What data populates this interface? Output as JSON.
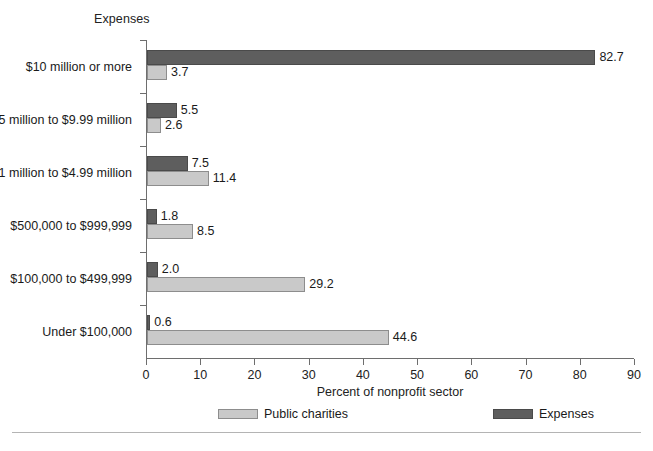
{
  "chart_data": {
    "type": "bar",
    "orientation": "horizontal",
    "title": "Expenses",
    "xlabel": "Percent of nonprofit sector",
    "ylabel": "",
    "xlim": [
      0,
      90
    ],
    "xticks": [
      0,
      10,
      20,
      30,
      40,
      50,
      60,
      70,
      80,
      90
    ],
    "grid": false,
    "legend_position": "bottom",
    "categories": [
      "$10 million or more",
      "$5 million to $9.99 million",
      "$1 million to $4.99 million",
      "$500,000 to $999,999",
      "$100,000 to $499,999",
      "Under $100,000"
    ],
    "series": [
      {
        "name": "Expenses",
        "color": "#5e5e5e",
        "values": [
          82.7,
          5.5,
          7.5,
          1.8,
          2.0,
          0.6
        ],
        "labels": [
          "82.7",
          "5.5",
          "7.5",
          "1.8",
          "2.0",
          "0.6"
        ]
      },
      {
        "name": "Public charities",
        "color": "#c9c9c9",
        "values": [
          3.7,
          2.6,
          11.4,
          8.5,
          29.2,
          44.6
        ],
        "labels": [
          "3.7",
          "2.6",
          "11.4",
          "8.5",
          "29.2",
          "44.6"
        ]
      }
    ]
  },
  "xtick_labels": [
    "0",
    "10",
    "20",
    "30",
    "40",
    "50",
    "60",
    "70",
    "80",
    "90"
  ],
  "legend": [
    {
      "label": "Public charities",
      "key": "charities"
    },
    {
      "label": "Expenses",
      "key": "expenses"
    }
  ]
}
